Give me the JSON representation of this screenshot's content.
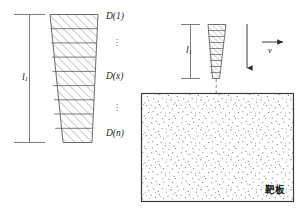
{
  "figure": {
    "background": "#ffffff",
    "line_color": "#555555",
    "hatch_color": "#777777",
    "speckle_color": "#5f5f6a",
    "plate_border": "#3a3a3a"
  },
  "left_diagram": {
    "length_label": "l",
    "length_subscript": "1",
    "segment_labels": [
      {
        "key": "first",
        "text": "D(1)"
      },
      {
        "key": "middle",
        "text": "D(x)"
      },
      {
        "key": "last",
        "text": "D(n)"
      }
    ],
    "ellipsis_upper": "⋮",
    "ellipsis_lower": "⋮",
    "segment_count": 9,
    "dot_glyph": "."
  },
  "right_diagram": {
    "length_label": "l",
    "length_subscript": "1",
    "velocity_label": "v",
    "velocity_arrow_direction": "down",
    "velocity_vector_arrow": "right",
    "segment_count": 9,
    "centerline_style": "dashed"
  },
  "target_plate": {
    "label": "靶板",
    "label_meaning": "target plate"
  }
}
